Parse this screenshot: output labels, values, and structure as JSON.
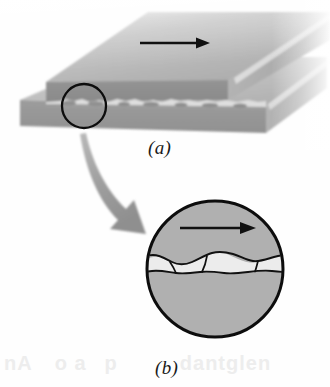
{
  "figure": {
    "background_color": "#fefefe",
    "panels": [
      {
        "id": "a",
        "label": "(a)",
        "caption_text": "(a)",
        "description": "Two stacked rectangular slabs in isometric view; the upper slab slides to the right over the lower slab. A small black circle marks a region of the contact interface that is enlarged in panel (b).",
        "slide_arrow": {
          "name": "sliding-direction-arrow",
          "direction": "right",
          "color": "#111111"
        },
        "detail_circle": {
          "name": "detail-callout-circle",
          "center_x": 84,
          "center_y": 106,
          "radius": 22,
          "stroke_color": "#0d0d0d"
        }
      },
      {
        "id": "b",
        "label": "(b)",
        "caption_text": "(b)",
        "description": "Magnified circular view of the contact interface showing the wavy rough surfaces of the two bodies touching at discrete asperities with open gaps in between.",
        "slide_arrow": {
          "name": "sliding-direction-arrow",
          "direction": "right",
          "color": "#111111"
        },
        "circle": {
          "name": "magnified-contact-circle",
          "center_x": 215,
          "center_y": 269,
          "radius": 69,
          "stroke_color": "#0d0d0d"
        }
      }
    ],
    "callout_arrow": {
      "name": "magnification-callout-arrow",
      "color": "#9a9a9a",
      "from_panel": "a",
      "to_panel": "b"
    },
    "colors": {
      "top_face_light": "#cbcbcb",
      "top_face_mid": "#b4b4b4",
      "front_face_dark": "#8d8d8d",
      "front_face_mid": "#9a9a9a",
      "body_fill": "#b0b0b0",
      "gap_fill": "#ececec",
      "outline": "#0d0d0d",
      "callout_arrow": "#9a9a9a",
      "bleed_text": "#ededed"
    },
    "bleed_through_text": {
      "name": "scan-bleed-text",
      "segments": [
        "nA",
        "o a",
        "p",
        "dantglen"
      ]
    }
  }
}
